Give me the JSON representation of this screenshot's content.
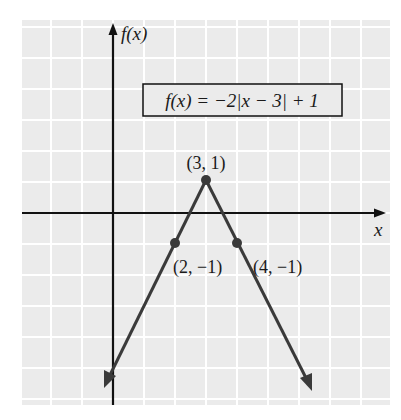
{
  "chart_data": {
    "type": "line",
    "title": "",
    "function_label": "f(x) = −2|x − 3| + 1",
    "xlabel": "x",
    "ylabel": "f(x)",
    "xlim": [
      -3,
      9
    ],
    "ylim": [
      -6,
      6
    ],
    "grid": true,
    "series": [
      {
        "name": "f(x) = −2|x − 3| + 1",
        "x": [
          0,
          2,
          3,
          4,
          6
        ],
        "y": [
          -5,
          -1,
          1,
          -1,
          -5
        ]
      }
    ],
    "labeled_points": [
      {
        "x": 3,
        "y": 1,
        "label": "(3, 1)"
      },
      {
        "x": 2,
        "y": -1,
        "label": "(2, −1)"
      },
      {
        "x": 4,
        "y": -1,
        "label": "(4, −1)"
      }
    ]
  },
  "labels": {
    "y_axis": "f(x)",
    "x_axis": "x",
    "equation": "f(x) = −2|x − 3| + 1",
    "vertex": "(3, 1)",
    "point_left": "(2, −1)",
    "point_right": "(4, −1)"
  }
}
